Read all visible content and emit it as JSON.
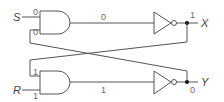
{
  "diagram": {
    "title": "",
    "inputs": [
      {
        "name": "S",
        "value_at_gate": "0"
      },
      {
        "name": "R",
        "value_at_gate": "1"
      }
    ],
    "outputs": [
      {
        "name": "X",
        "value": "1"
      },
      {
        "name": "Y",
        "value": "0"
      }
    ],
    "top_gate": {
      "type": "AND",
      "input1_value": "0",
      "input2_value": "0",
      "output_value": "0"
    },
    "bottom_gate": {
      "type": "AND",
      "input1_value": "1",
      "input2_value": "1",
      "output_value": "1"
    },
    "inverters": [
      {
        "position": "top",
        "output": "X"
      },
      {
        "position": "bottom",
        "output": "Y"
      }
    ],
    "feedback": "X feeds bottom AND input 1; Y feeds top AND input 2 (cross-coupled)"
  }
}
